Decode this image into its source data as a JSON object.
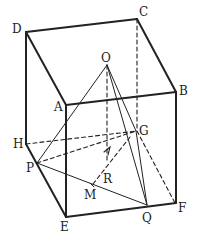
{
  "diagram": {
    "type": "geometry-cuboid",
    "stroke_color": "#222222",
    "labels": {
      "A": "A",
      "B": "B",
      "C": "C",
      "D": "D",
      "E": "E",
      "F": "F",
      "G": "G",
      "H": "H",
      "O": "O",
      "P": "P",
      "Q": "Q",
      "R": "R",
      "M": "M"
    }
  }
}
